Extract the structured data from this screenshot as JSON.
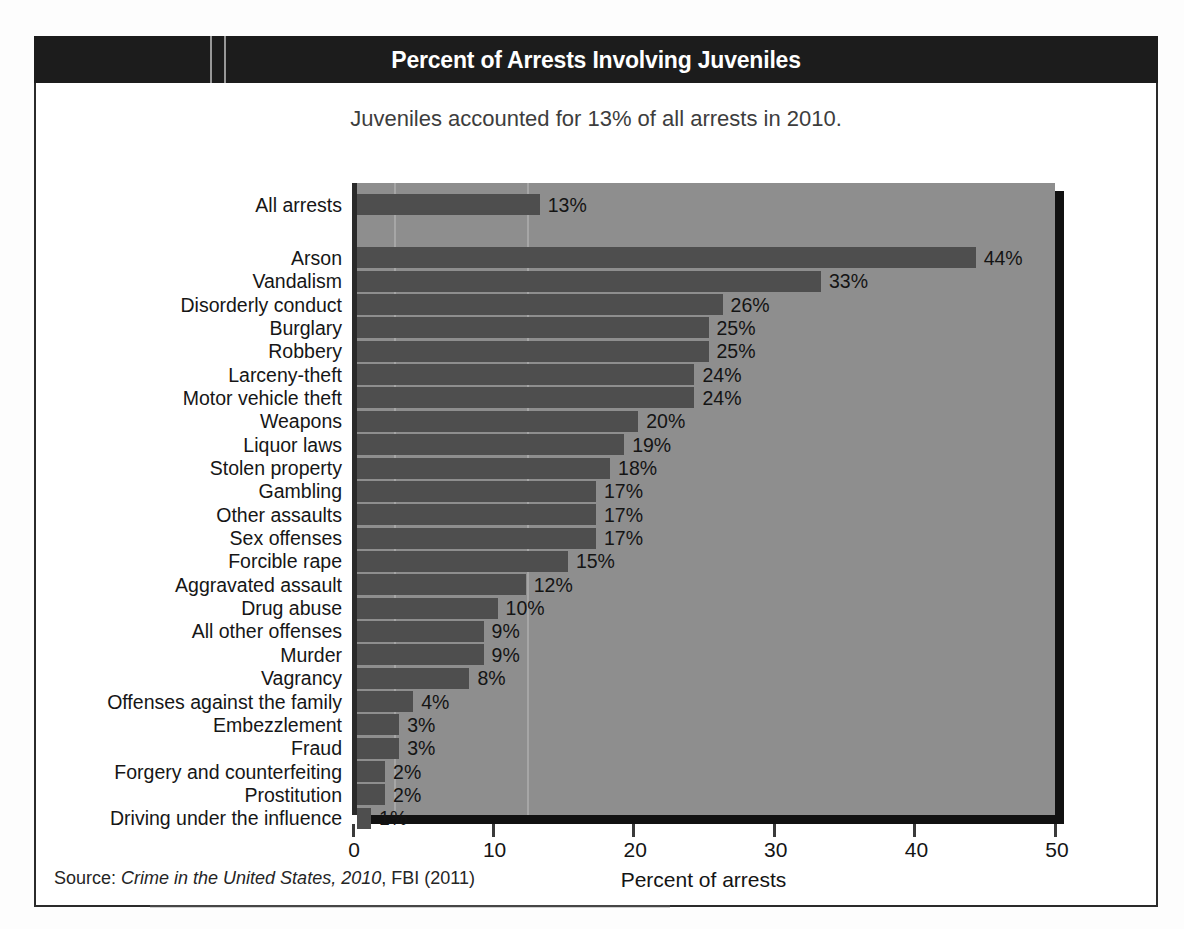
{
  "banner": {
    "title": "Percent of Arrests Involving Juveniles"
  },
  "subtitle": "Juveniles accounted for 13% of all arrests in 2010.",
  "source": {
    "prefix": "Source: ",
    "italic": "Crime in the United States, 2010",
    "suffix": ", FBI (2011)"
  },
  "colors": {
    "banner_bg": "#1c1c1c",
    "banner_text": "#ffffff",
    "plot_bg": "#8e8e8e",
    "bar": "#4e4e4e",
    "axis": "#2a2a2a",
    "shadow": "#111111",
    "text": "#141414"
  },
  "chart_data": {
    "type": "bar",
    "orientation": "horizontal",
    "title": "Percent of Arrests Involving Juveniles",
    "subtitle": "Juveniles accounted for 13% of all arrests in 2010.",
    "xlabel": "Percent of arrests",
    "ylabel": "",
    "xlim": [
      0,
      50
    ],
    "xticks": [
      0,
      10,
      20,
      30,
      40,
      50
    ],
    "xtick_labels": [
      "0",
      "10",
      "20",
      "30",
      "40",
      "50"
    ],
    "grid": false,
    "legend": null,
    "value_label_suffix": "%",
    "categories": [
      "All arrests",
      "Arson",
      "Vandalism",
      "Disorderly conduct",
      "Burglary",
      "Robbery",
      "Larceny-theft",
      "Motor vehicle theft",
      "Weapons",
      "Liquor laws",
      "Stolen property",
      "Gambling",
      "Other assaults",
      "Sex offenses",
      "Forcible rape",
      "Aggravated assault",
      "Drug abuse",
      "All other offenses",
      "Murder",
      "Vagrancy",
      "Offenses against the family",
      "Embezzlement",
      "Fraud",
      "Forgery and counterfeiting",
      "Prostitution",
      "Driving under the influence"
    ],
    "values": [
      13,
      44,
      33,
      26,
      25,
      25,
      24,
      24,
      20,
      19,
      18,
      17,
      17,
      17,
      15,
      12,
      10,
      9,
      9,
      8,
      4,
      3,
      3,
      2,
      2,
      1
    ],
    "value_labels": [
      "13%",
      "44%",
      "33%",
      "26%",
      "25%",
      "25%",
      "24%",
      "24%",
      "20%",
      "19%",
      "18%",
      "17%",
      "17%",
      "17%",
      "15%",
      "12%",
      "10%",
      "9%",
      "9%",
      "8%",
      "4%",
      "3%",
      "3%",
      "2%",
      "2%",
      "1%"
    ],
    "group_gap_after_index": 0
  }
}
